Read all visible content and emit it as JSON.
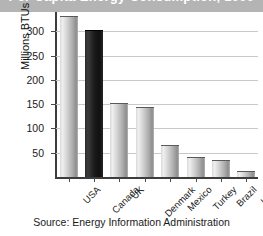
{
  "chart_data": {
    "type": "bar",
    "title": "Per Capita Energy Consumption, 1999",
    "categories": [
      "USA",
      "Canada",
      "UK",
      "Denmark",
      "Mexico",
      "Turkey",
      "Brazil",
      "India"
    ],
    "values": [
      330,
      300,
      150,
      143,
      63,
      39,
      33,
      11
    ],
    "xlabel": "",
    "ylabel": "Millions BTUs",
    "ylim": [
      0,
      340
    ],
    "yticks": [
      50,
      100,
      150,
      200,
      250,
      300
    ],
    "ytick_labels": [
      "50",
      "100",
      "150",
      "200",
      "250",
      "300"
    ],
    "grid": true,
    "legend": "none",
    "source": "Source: Energy Information Administration",
    "colors": {
      "bar_light": "#c9c9c9",
      "bar_highlight": "#1c1c1c",
      "gridline": "#c9c9c9",
      "axis": "#3d3d3d",
      "title_band": "#b4b4b4",
      "background": "#ffffff"
    },
    "highlight_category": "Canada"
  }
}
